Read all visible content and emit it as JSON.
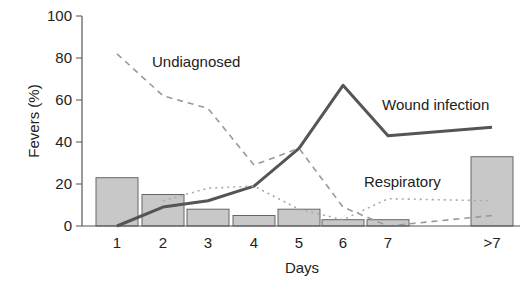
{
  "chart_data": {
    "type": "bar+line",
    "title": "",
    "xlabel": "Days",
    "ylabel": "Fevers (%)",
    "ylim": [
      0,
      100
    ],
    "yticks": [
      0,
      20,
      40,
      60,
      80,
      100
    ],
    "categories": [
      "1",
      "2",
      "3",
      "4",
      "5",
      "6",
      "7",
      ">7"
    ],
    "grid": false,
    "legend": "inline annotations",
    "bars": {
      "name": "All fevers",
      "values": [
        23,
        15,
        8,
        5,
        8,
        3,
        3,
        33
      ],
      "color": "#c8c8c8"
    },
    "series": [
      {
        "name": "Wound infection",
        "style": "solid",
        "values": [
          0,
          9,
          12,
          19,
          37,
          67,
          43,
          47
        ],
        "color": "#555555"
      },
      {
        "name": "Undiagnosed",
        "style": "dashed",
        "values": [
          82,
          62,
          56,
          29,
          37,
          9,
          0,
          5
        ],
        "color": "#999999"
      },
      {
        "name": "Respiratory",
        "style": "dotted",
        "values": [
          null,
          12,
          18,
          19,
          8,
          3,
          13,
          12
        ],
        "color": "#aaaaaa"
      }
    ],
    "annotations": [
      {
        "text": "Undiagnosed",
        "near": "day 2-3, y≈80"
      },
      {
        "text": "Wound infection",
        "near": "day 7, y≈58"
      },
      {
        "text": "Respiratory",
        "near": "day 7, y≈20"
      }
    ]
  },
  "labels": {
    "y_axis": "Fevers (%)",
    "x_axis": "Days",
    "yticks": [
      "0",
      "20",
      "40",
      "60",
      "80",
      "100"
    ],
    "xticks": [
      "1",
      "2",
      "3",
      "4",
      "5",
      "6",
      "7",
      ">7"
    ],
    "undiagnosed": "Undiagnosed",
    "wound": "Wound infection",
    "respiratory": "Respiratory"
  }
}
